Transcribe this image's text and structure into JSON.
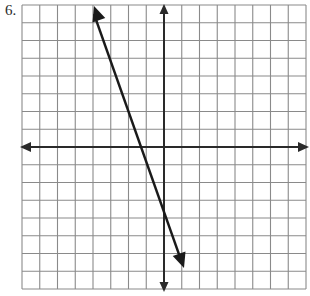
{
  "problem": {
    "number_label": "6."
  },
  "grid": {
    "left": 22,
    "top": 5,
    "cell": 17.75,
    "cols": 16,
    "rows": 16,
    "origin_col": 8,
    "origin_row": 8,
    "grid_color": "#8a8a8a",
    "axis_color": "#2a2a2a",
    "line_color": "#1a1a1a"
  },
  "chart_data": {
    "type": "line",
    "title": "",
    "xlabel": "",
    "ylabel": "",
    "xlim": [
      -8,
      8
    ],
    "ylim": [
      -8,
      8
    ],
    "grid": true,
    "tick_labels": false,
    "series": [
      {
        "name": "line",
        "equation": "y = -3x - 4",
        "slope": -3,
        "intercept": -4,
        "x": [
          -4,
          1
        ],
        "y": [
          8,
          -7
        ],
        "arrows": "both"
      }
    ],
    "x_intercept": -1.333,
    "y_intercept": -4
  }
}
